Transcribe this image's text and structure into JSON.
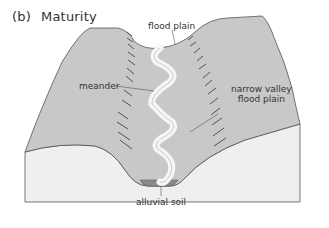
{
  "figure": {
    "part_label": "(b)",
    "title": "Maturity"
  },
  "labels": {
    "flood_plain_top": "flood plain",
    "meander": "meander",
    "narrow_valley_line1": "narrow valley",
    "narrow_valley_line2": "flood plain",
    "alluvial_soil": "alluvial soil"
  },
  "colors": {
    "land_surface": "#c8c8c8",
    "block_side": "#efefef",
    "river": "#f6f6f6",
    "alluvial_soil": "#8a8a8a",
    "outline": "#555555",
    "text": "#333333"
  }
}
